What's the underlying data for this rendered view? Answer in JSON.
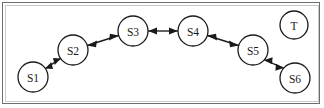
{
  "figure": {
    "background_color": "#ffffff",
    "outer_border_color": "#6d6d6d",
    "inner_border_color": "#c9c9c9",
    "stroke_color": "#1a1a1a"
  },
  "nodes": [
    {
      "id": "S1",
      "label": "S1",
      "cx": 33,
      "cy": 77,
      "r": 15
    },
    {
      "id": "S2",
      "label": "S2",
      "cx": 73,
      "cy": 50,
      "r": 15
    },
    {
      "id": "S3",
      "label": "S3",
      "cx": 133,
      "cy": 31,
      "r": 15
    },
    {
      "id": "S4",
      "label": "S4",
      "cx": 193,
      "cy": 31,
      "r": 15
    },
    {
      "id": "S5",
      "label": "S5",
      "cx": 253,
      "cy": 50,
      "r": 15
    },
    {
      "id": "S6",
      "label": "S6",
      "cx": 295,
      "cy": 78,
      "r": 15
    },
    {
      "id": "T",
      "label": "T",
      "cx": 294,
      "cy": 25,
      "r": 14
    }
  ],
  "edges": [
    {
      "from": "S1",
      "to": "S2",
      "direction": "bidirectional"
    },
    {
      "from": "S2",
      "to": "S3",
      "direction": "bidirectional"
    },
    {
      "from": "S3",
      "to": "S4",
      "direction": "bidirectional"
    },
    {
      "from": "S4",
      "to": "S5",
      "direction": "bidirectional"
    },
    {
      "from": "S5",
      "to": "S6",
      "direction": "bidirectional"
    }
  ],
  "isolated_nodes": [
    "T"
  ]
}
